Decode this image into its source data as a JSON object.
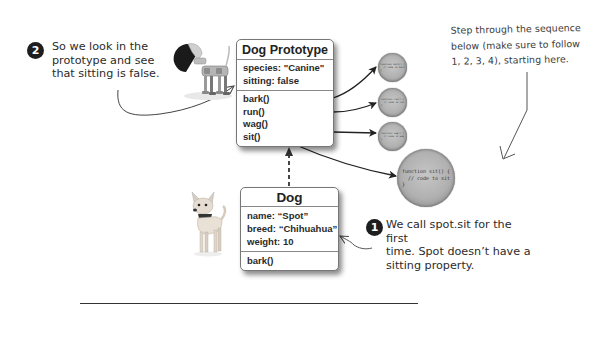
{
  "prototype_box": {
    "title": "Dog Prototype",
    "properties": [
      "species: \"Canine\"",
      "sitting: false"
    ],
    "methods": [
      "bark()",
      "run()",
      "wag()",
      "sit()"
    ]
  },
  "dog_box": {
    "title": "Dog",
    "properties": [
      "name: “Spot”",
      "breed: “Chihuahua”",
      "weight: 10"
    ],
    "methods": [
      "bark()"
    ]
  },
  "callouts": {
    "step1": {
      "badge": "1",
      "lines": [
        "We call spot.sit for the first",
        "time. Spot doesn’t have a",
        "sitting property."
      ]
    },
    "step2": {
      "badge": "2",
      "lines": [
        "So we look in the",
        "prototype and see",
        "that sitting is false."
      ]
    }
  },
  "hand_note": {
    "lines": [
      "Step through the sequence",
      "below (make sure to follow",
      "1, 2, 3, 4), starting here."
    ]
  },
  "function_circles": {
    "bark": "function bark() {\n  // code to bark\n}",
    "run": "function run() {\n  // code to run\n}",
    "wag": "function wag() {\n  // code to wag\n}",
    "sit": "function sit() {\n  // code to sit\n}"
  },
  "illustrations": {
    "robot_dog": "robot-dog",
    "chihuahua": "chihuahua-dog"
  },
  "colors": {
    "badge": "#1e1e1e",
    "circle_fill": "#b0b0b0",
    "wire": "#222222",
    "divider": "#333333"
  }
}
